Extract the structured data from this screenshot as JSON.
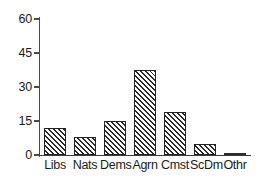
{
  "chart_data": {
    "type": "bar",
    "title": "",
    "xlabel": "",
    "ylabel": "",
    "categories": [
      "Libs",
      "Nats",
      "Dems",
      "Agrn",
      "Cmst",
      "ScDm",
      "Othr"
    ],
    "values": [
      12,
      8,
      15,
      37.5,
      19,
      5,
      0.5
    ],
    "ylim": [
      0,
      60
    ],
    "yticks": [
      0,
      15,
      30,
      45,
      60
    ],
    "ytick_labels": [
      "0",
      "15",
      "30",
      "45",
      "60"
    ],
    "grid": false,
    "legend": false,
    "bar_style": {
      "fill": "hatched-diagonal",
      "edge_color": "#222222",
      "face_color": "#ffffff"
    },
    "axis_color": "#3a3a3a",
    "background": "#ffffff"
  }
}
